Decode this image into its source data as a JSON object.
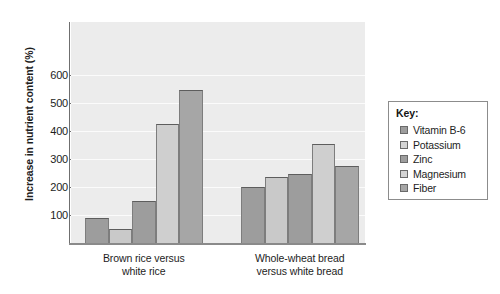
{
  "chart_data": {
    "type": "bar",
    "title": "",
    "xlabel": "",
    "ylabel": "Increase in nutrient content (%)",
    "ylim": [
      0,
      650
    ],
    "yticks": [
      100,
      200,
      300,
      400,
      500,
      600
    ],
    "grid": true,
    "legend_position": "right",
    "legend_title": "Key:",
    "categories": [
      "Brown rice versus white rice",
      "Whole-wheat bread versus white bread"
    ],
    "series": [
      {
        "name": "Vitamin B-6",
        "color": "#9d9d9d",
        "values": [
          90,
          200
        ]
      },
      {
        "name": "Potassium",
        "color": "#c9c9c9",
        "values": [
          50,
          237
        ]
      },
      {
        "name": "Zinc",
        "color": "#9d9d9d",
        "values": [
          150,
          247
        ]
      },
      {
        "name": "Magnesium",
        "color": "#cfcfcf",
        "values": [
          425,
          355
        ]
      },
      {
        "name": "Fiber",
        "color": "#a6a6a6",
        "values": [
          548,
          275
        ]
      }
    ]
  },
  "axis": {
    "y_title": "Increase in nutrient content (%)",
    "tick_labels": [
      "600",
      "500",
      "400",
      "300",
      "200",
      "100"
    ]
  },
  "group_labels": [
    {
      "line1": "Brown rice versus",
      "line2": "white rice"
    },
    {
      "line1": "Whole-wheat bread",
      "line2": "versus white bread"
    }
  ],
  "legend": {
    "title": "Key:",
    "items": [
      {
        "label": "Vitamin B-6",
        "color": "#9d9d9d"
      },
      {
        "label": "Potassium",
        "color": "#d4d4d4"
      },
      {
        "label": "Zinc",
        "color": "#9d9d9d"
      },
      {
        "label": "Magnesium",
        "color": "#d4d4d4"
      },
      {
        "label": "Fiber",
        "color": "#a6a6a6"
      }
    ]
  },
  "colors": {
    "plot_background": "#ececec",
    "gridline": "#fbfbfb",
    "axis": "#6f6f6f",
    "text": "#1d1d1d"
  }
}
